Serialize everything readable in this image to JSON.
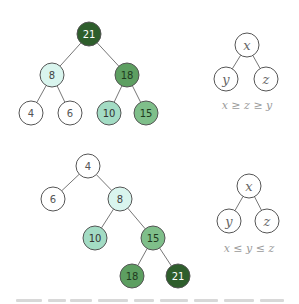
{
  "colors": {
    "white": "#ffffff",
    "pale": "#d9f5ee",
    "light": "#a3dcc4",
    "medium": "#7fbf8a",
    "mid_dark": "#5d9f61",
    "dark": "#2e5e2c",
    "stroke": "#555555",
    "edge": "#777777"
  },
  "max_heap": {
    "nodes": [
      {
        "id": "n21",
        "label": "21",
        "x": 89,
        "y": 34,
        "fill": "dark",
        "text": "#ffffff"
      },
      {
        "id": "n8",
        "label": "8",
        "x": 52,
        "y": 75,
        "fill": "pale",
        "text": "#444444"
      },
      {
        "id": "n18",
        "label": "18",
        "x": 127,
        "y": 75,
        "fill": "mid_dark",
        "text": "#1f3b1f"
      },
      {
        "id": "n4",
        "label": "4",
        "x": 31,
        "y": 113,
        "fill": "white",
        "text": "#555555"
      },
      {
        "id": "n6",
        "label": "6",
        "x": 70,
        "y": 113,
        "fill": "white",
        "text": "#555555"
      },
      {
        "id": "n10",
        "label": "10",
        "x": 109,
        "y": 113,
        "fill": "light",
        "text": "#333333"
      },
      {
        "id": "n15",
        "label": "15",
        "x": 146,
        "y": 113,
        "fill": "medium",
        "text": "#1f3b1f"
      }
    ],
    "edges": [
      [
        "n21",
        "n8"
      ],
      [
        "n21",
        "n18"
      ],
      [
        "n8",
        "n4"
      ],
      [
        "n8",
        "n6"
      ],
      [
        "n18",
        "n10"
      ],
      [
        "n18",
        "n15"
      ]
    ]
  },
  "max_template": {
    "nodes": [
      {
        "id": "x",
        "label": "x",
        "x": 247,
        "y": 45
      },
      {
        "id": "y",
        "label": "y",
        "x": 226,
        "y": 79
      },
      {
        "id": "z",
        "label": "z",
        "x": 266,
        "y": 79
      }
    ],
    "edges": [
      [
        "x",
        "y"
      ],
      [
        "x",
        "z"
      ]
    ],
    "caption": "x ≥ z ≥ y"
  },
  "min_heap": {
    "nodes": [
      {
        "id": "m4",
        "label": "4",
        "x": 88,
        "y": 166,
        "fill": "white",
        "text": "#555555"
      },
      {
        "id": "m6",
        "label": "6",
        "x": 53,
        "y": 199,
        "fill": "white",
        "text": "#555555"
      },
      {
        "id": "m8",
        "label": "8",
        "x": 120,
        "y": 199,
        "fill": "pale",
        "text": "#444444"
      },
      {
        "id": "m10",
        "label": "10",
        "x": 95,
        "y": 238,
        "fill": "light",
        "text": "#333333"
      },
      {
        "id": "m15",
        "label": "15",
        "x": 153,
        "y": 238,
        "fill": "medium",
        "text": "#1f3b1f"
      },
      {
        "id": "m18",
        "label": "18",
        "x": 132,
        "y": 276,
        "fill": "mid_dark",
        "text": "#1f3b1f"
      },
      {
        "id": "m21",
        "label": "21",
        "x": 178,
        "y": 276,
        "fill": "dark",
        "text": "#ffffff"
      }
    ],
    "edges": [
      [
        "m4",
        "m6"
      ],
      [
        "m4",
        "m8"
      ],
      [
        "m8",
        "m10"
      ],
      [
        "m8",
        "m15"
      ],
      [
        "m15",
        "m18"
      ],
      [
        "m15",
        "m21"
      ]
    ]
  },
  "min_template": {
    "nodes": [
      {
        "id": "x",
        "label": "x",
        "x": 249,
        "y": 186
      },
      {
        "id": "y",
        "label": "y",
        "x": 229,
        "y": 221
      },
      {
        "id": "z",
        "label": "z",
        "x": 267,
        "y": 221
      }
    ],
    "edges": [
      [
        "x",
        "y"
      ],
      [
        "x",
        "z"
      ]
    ],
    "caption": "x ≤ y ≤ z"
  }
}
